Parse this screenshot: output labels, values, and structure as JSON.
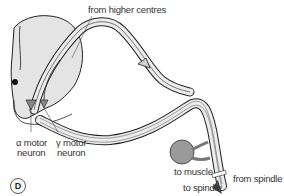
{
  "figure": {
    "panel_label": "D",
    "labels": {
      "from_higher_centres": "from higher centres",
      "alpha_motor_neuron_line1": "α motor",
      "alpha_motor_neuron_line2": "neuron",
      "gamma_motor_neuron_line1": "γ motor",
      "gamma_motor_neuron_line2": "neuron",
      "to_muscle": "to muscle",
      "to_spindle": "to spindle",
      "from_spindle": "from spindle"
    },
    "colors": {
      "spinal_cord_fill": "#e4e4e4",
      "nerve_fill": "#ececec",
      "outline": "#222222",
      "muscle_fill": "#9a9a9a",
      "neuron_fill": "#888888"
    }
  }
}
